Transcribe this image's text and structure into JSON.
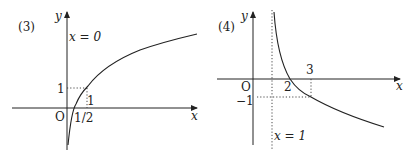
{
  "panels": [
    {
      "label": "(3)",
      "x_axis_label": "x",
      "y_axis_label": "y",
      "origin_label": "O",
      "asymptote_label": "x = 0",
      "ticks": {
        "y_one": "1",
        "x_one": "1",
        "x_half": "1/2"
      }
    },
    {
      "label": "(4)",
      "x_axis_label": "x",
      "y_axis_label": "y",
      "origin_label": "O",
      "asymptote_label": "x = 1",
      "ticks": {
        "x_two": "2",
        "x_three": "3",
        "y_neg_one": "−1"
      }
    }
  ]
}
